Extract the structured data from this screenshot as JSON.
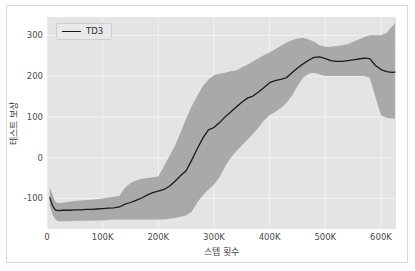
{
  "chart_data": {
    "type": "line",
    "title": "",
    "subtitle": "",
    "xlabel": "스텝 횟수",
    "ylabel": "테스트 보상",
    "xlim": [
      0,
      627000
    ],
    "ylim": [
      -175,
      345
    ],
    "grid": true,
    "legend_position": "upper left",
    "xticks": [
      0,
      100000,
      200000,
      300000,
      400000,
      500000,
      600000
    ],
    "xtick_labels": [
      "0",
      "100K",
      "200K",
      "300K",
      "400K",
      "500K",
      "600K"
    ],
    "yticks": [
      -100,
      0,
      100,
      200,
      300
    ],
    "ytick_labels": [
      "-100",
      "0",
      "100",
      "200",
      "300"
    ],
    "series": [
      {
        "name": "TD3",
        "color": "#1a1a1a",
        "band_color": "#a9a9a9",
        "x": [
          5000,
          10000,
          15000,
          20000,
          30000,
          40000,
          50000,
          60000,
          70000,
          80000,
          90000,
          100000,
          110000,
          120000,
          130000,
          140000,
          150000,
          160000,
          170000,
          180000,
          190000,
          200000,
          210000,
          220000,
          230000,
          240000,
          250000,
          260000,
          270000,
          280000,
          290000,
          300000,
          310000,
          320000,
          330000,
          340000,
          350000,
          360000,
          370000,
          380000,
          390000,
          400000,
          410000,
          420000,
          430000,
          440000,
          450000,
          460000,
          470000,
          480000,
          490000,
          500000,
          510000,
          520000,
          530000,
          540000,
          550000,
          560000,
          570000,
          580000,
          590000,
          600000,
          610000,
          620000,
          625000
        ],
        "y": [
          -98,
          -118,
          -128,
          -130,
          -129,
          -129,
          -128,
          -128,
          -127,
          -127,
          -126,
          -125,
          -124,
          -123,
          -121,
          -114,
          -110,
          -105,
          -99,
          -92,
          -86,
          -82,
          -78,
          -70,
          -58,
          -44,
          -32,
          -6,
          22,
          48,
          68,
          74,
          86,
          100,
          112,
          124,
          136,
          146,
          151,
          161,
          172,
          184,
          189,
          192,
          196,
          208,
          220,
          230,
          239,
          246,
          247,
          243,
          238,
          236,
          236,
          238,
          240,
          242,
          244,
          243,
          226,
          216,
          211,
          209,
          210
        ],
        "y_lower": [
          -118,
          -140,
          -152,
          -156,
          -156,
          -156,
          -155,
          -155,
          -155,
          -155,
          -154,
          -154,
          -153,
          -152,
          -152,
          -152,
          -152,
          -152,
          -152,
          -152,
          -152,
          -152,
          -152,
          -150,
          -148,
          -145,
          -142,
          -132,
          -110,
          -92,
          -78,
          -66,
          -48,
          -22,
          0,
          16,
          30,
          44,
          58,
          74,
          92,
          104,
          112,
          122,
          134,
          152,
          176,
          196,
          206,
          208,
          204,
          200,
          200,
          200,
          200,
          200,
          200,
          200,
          200,
          196,
          148,
          104,
          98,
          96,
          96
        ],
        "y_upper": [
          -72,
          -92,
          -108,
          -112,
          -110,
          -108,
          -106,
          -105,
          -104,
          -103,
          -102,
          -100,
          -98,
          -96,
          -94,
          -74,
          -62,
          -56,
          -52,
          -50,
          -48,
          -46,
          -22,
          4,
          30,
          62,
          96,
          126,
          152,
          176,
          192,
          202,
          206,
          208,
          212,
          214,
          222,
          228,
          236,
          244,
          252,
          258,
          266,
          274,
          282,
          288,
          292,
          294,
          290,
          284,
          276,
          272,
          272,
          274,
          276,
          278,
          284,
          290,
          296,
          300,
          300,
          300,
          306,
          322,
          330
        ]
      }
    ]
  },
  "legend": {
    "items": [
      {
        "label": "TD3"
      }
    ]
  },
  "axes": {
    "xlabel": "스텝 횟수",
    "ylabel": "테스트 보상",
    "xtick_labels": [
      "0",
      "100K",
      "200K",
      "300K",
      "400K",
      "500K",
      "600K"
    ],
    "ytick_labels": [
      "300",
      "200",
      "100",
      "0",
      "-100"
    ]
  },
  "colors": {
    "figure_background": "#ffffff",
    "plot_background": "#e4e4e4",
    "grid": "#f2f2f2",
    "line": "#1a1a1a",
    "band": "#a9a9a9",
    "tick_text": "#4c4c4c",
    "axis_title": "#3d3d3d",
    "frame_border": "#d8d8d8"
  }
}
